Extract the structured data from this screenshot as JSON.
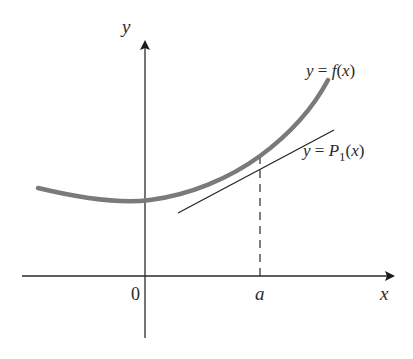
{
  "figure": {
    "axes": {
      "x_label": "x",
      "y_label": "y",
      "origin_label": "0",
      "point_label": "a"
    },
    "curves": [
      {
        "id": "f",
        "label": "y = f(x)",
        "label_parts": {
          "lhs": "y",
          "eq": " = ",
          "name": "f",
          "open": "(",
          "arg": "x",
          "close": ")"
        },
        "style": "thick gray",
        "color": "#7a7a7a"
      },
      {
        "id": "P1",
        "label": "y = P1(x)",
        "label_parts": {
          "lhs": "y",
          "eq": " = ",
          "name": "P",
          "sub": "1",
          "open": "(",
          "arg": "x",
          "close": ")"
        },
        "style": "thin black",
        "color": "#222222"
      }
    ],
    "annotations": {
      "tangent_point": "(a, f(a))",
      "dashed_line": "vertical from a to the curve"
    },
    "colors": {
      "axis": "#2a2a2a",
      "curve_f": "#7a7a7a",
      "tangent": "#222222",
      "background": "#ffffff"
    }
  }
}
